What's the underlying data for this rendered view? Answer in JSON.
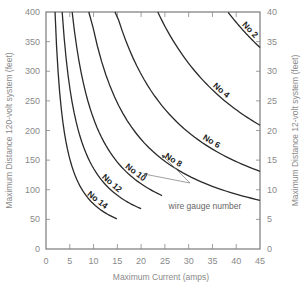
{
  "chart_data": {
    "type": "line",
    "title": "",
    "xlabel": "Maximum Current (amps)",
    "ylabel": "Maximum Distance  120-volt system (feet)",
    "y2label": "Maximum Distance  12-volt system (feet)",
    "xlim": [
      0,
      45
    ],
    "ylim": [
      0,
      400
    ],
    "y2lim": [
      0,
      40
    ],
    "xticks": [
      0,
      5,
      10,
      15,
      20,
      25,
      30,
      35,
      40,
      45
    ],
    "yticks": [
      0,
      50,
      100,
      150,
      200,
      250,
      300,
      350,
      400
    ],
    "y2ticks": [
      0,
      5,
      10,
      15,
      20,
      25,
      30,
      35,
      40
    ],
    "grid": false,
    "annotation": "wire gauge number",
    "series": [
      {
        "name": "No 14",
        "label_pos": {
          "x": 10.5,
          "y": 100
        },
        "x_range": [
          1.9,
          14.9
        ],
        "k": 760
      },
      {
        "name": "No 12",
        "label_pos": {
          "x": 13.5,
          "y": 115
        },
        "x_range": [
          3.4,
          20.0
        ],
        "k": 1360
      },
      {
        "name": "No 10",
        "label_pos": {
          "x": 18.5,
          "y": 135
        },
        "x_range": [
          5.5,
          24.4
        ],
        "k": 2200
      },
      {
        "name": "No 8",
        "label_pos": {
          "x": 26.5,
          "y": 170
        },
        "x_range": [
          9.0,
          45.0
        ],
        "k": 3700
      },
      {
        "name": "No 6",
        "label_pos": {
          "x": 34.5,
          "y": 220
        },
        "x_range": [
          14.5,
          45.0
        ],
        "k": 5900
      },
      {
        "name": "No 4",
        "label_pos": {
          "x": 36.5,
          "y": 290
        },
        "x_range": [
          23.5,
          45.0
        ],
        "k": 9400
      },
      {
        "name": "No 2",
        "label_pos": {
          "x": 42.5,
          "y": 375
        },
        "x_range": [
          38.3,
          45.0
        ],
        "k": 15300
      }
    ],
    "series_points": {
      "No 14": [
        [
          1.9,
          400
        ],
        [
          3,
          253
        ],
        [
          5,
          152
        ],
        [
          7.5,
          101
        ],
        [
          10,
          76
        ],
        [
          12.5,
          61
        ],
        [
          14.9,
          51
        ]
      ],
      "No 12": [
        [
          3.4,
          400
        ],
        [
          5,
          272
        ],
        [
          7.5,
          181
        ],
        [
          10,
          136
        ],
        [
          12.5,
          109
        ],
        [
          15,
          91
        ],
        [
          17.5,
          78
        ],
        [
          20,
          68
        ]
      ],
      "No 10": [
        [
          5.5,
          400
        ],
        [
          7.5,
          293
        ],
        [
          10,
          220
        ],
        [
          12.5,
          176
        ],
        [
          15,
          147
        ],
        [
          17.5,
          126
        ],
        [
          20,
          110
        ],
        [
          22.5,
          98
        ],
        [
          24.4,
          90
        ]
      ],
      "No 8": [
        [
          9,
          400
        ],
        [
          10,
          370
        ],
        [
          15,
          247
        ],
        [
          20,
          185
        ],
        [
          25,
          148
        ],
        [
          30,
          123
        ],
        [
          35,
          106
        ],
        [
          40,
          93
        ],
        [
          45,
          82
        ]
      ],
      "No 6": [
        [
          14.5,
          400
        ],
        [
          17.5,
          337
        ],
        [
          20,
          295
        ],
        [
          25,
          236
        ],
        [
          30,
          197
        ],
        [
          35,
          169
        ],
        [
          40,
          148
        ],
        [
          45,
          131
        ]
      ],
      "No 4": [
        [
          23.5,
          400
        ],
        [
          25,
          376
        ],
        [
          30,
          313
        ],
        [
          35,
          269
        ],
        [
          40,
          235
        ],
        [
          45,
          209
        ]
      ],
      "No 2": [
        [
          38.3,
          400
        ],
        [
          40,
          383
        ],
        [
          42.5,
          360
        ],
        [
          45,
          340
        ]
      ]
    }
  }
}
